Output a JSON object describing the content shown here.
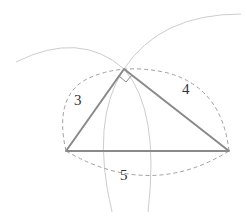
{
  "diagram": {
    "labels": {
      "side_a": "3",
      "side_b": "4",
      "side_c": "5"
    },
    "vertices": {
      "A": [
        66,
        151
      ],
      "B": [
        229,
        151
      ],
      "C": [
        124,
        69
      ]
    },
    "colors": {
      "triangle": "#8a8a8a",
      "arcs": "#c8c8c8",
      "dashed": "#9a9a9a",
      "text": "#333333"
    }
  }
}
